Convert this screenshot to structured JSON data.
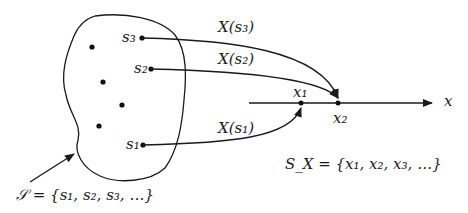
{
  "diagram": {
    "type": "random-variable-mapping",
    "sample_space": {
      "label": "S = {s1, s2, s3, ...}",
      "labeled_points": [
        "s1",
        "s2",
        "s3"
      ],
      "unlabeled_points": 4
    },
    "mappings": [
      {
        "from": "s3",
        "label": "X(s3)",
        "to": "x2"
      },
      {
        "from": "s2",
        "label": "X(s2)",
        "to": "x2"
      },
      {
        "from": "s1",
        "label": "X(s1)",
        "to": "x1"
      }
    ],
    "axis": {
      "label": "x",
      "points": [
        "x1",
        "x2"
      ]
    },
    "range_set": {
      "label": "SX = {x1, x2, x3, ...}"
    }
  },
  "labels": {
    "s1": "s₁",
    "s2": "s₂",
    "s3": "s₃",
    "Xs1": "X(s₁)",
    "Xs2": "X(s₂)",
    "Xs3": "X(s₃)",
    "x1": "x₁",
    "x2": "x₂",
    "axis": "x",
    "S_set": "𝒮 = {s₁, s₂, s₃, …}",
    "SX_set": "S_X = {x₁, x₂, x₃, …}"
  }
}
